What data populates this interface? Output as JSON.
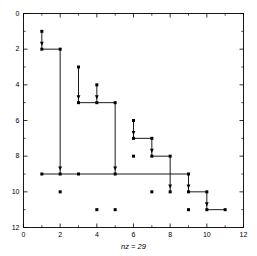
{
  "chart_data": {
    "type": "scatter",
    "title": "",
    "subtitle": "",
    "xlabel": "nz = 29",
    "ylabel": "",
    "xlim": [
      0,
      12
    ],
    "ylim": [
      12,
      0
    ],
    "y_axis_inverted": true,
    "grid": false,
    "legend": "none",
    "marker": "filled-square",
    "marker_color": "#000000",
    "marker_size_px": 3,
    "line_color": "#000000",
    "background_color": "#ffffff",
    "axis_color": "#000000",
    "nz": 29,
    "xticks": [
      0,
      2,
      4,
      6,
      8,
      10,
      12
    ],
    "yticks": [
      0,
      2,
      4,
      6,
      8,
      10,
      12
    ],
    "xtick_labels": [
      "0",
      "2",
      "4",
      "6",
      "8",
      "10",
      "12"
    ],
    "ytick_labels": [
      "0",
      "2",
      "4",
      "6",
      "8",
      "10",
      "12"
    ],
    "minor_xticks": [
      1,
      3,
      5,
      7,
      9,
      11
    ],
    "minor_yticks": [
      1,
      3,
      5,
      7,
      9,
      11
    ],
    "points": [
      {
        "x": 1,
        "y": 1
      },
      {
        "x": 1,
        "y": 2
      },
      {
        "x": 2,
        "y": 2
      },
      {
        "x": 3,
        "y": 3
      },
      {
        "x": 4,
        "y": 4
      },
      {
        "x": 3,
        "y": 5
      },
      {
        "x": 4,
        "y": 5
      },
      {
        "x": 5,
        "y": 5
      },
      {
        "x": 6,
        "y": 6
      },
      {
        "x": 6,
        "y": 7
      },
      {
        "x": 7,
        "y": 7
      },
      {
        "x": 6,
        "y": 8
      },
      {
        "x": 7,
        "y": 8
      },
      {
        "x": 8,
        "y": 8
      },
      {
        "x": 1,
        "y": 9
      },
      {
        "x": 2,
        "y": 9
      },
      {
        "x": 3,
        "y": 9
      },
      {
        "x": 5,
        "y": 9
      },
      {
        "x": 9,
        "y": 9
      },
      {
        "x": 2,
        "y": 10
      },
      {
        "x": 7,
        "y": 10
      },
      {
        "x": 8,
        "y": 10
      },
      {
        "x": 9,
        "y": 10
      },
      {
        "x": 10,
        "y": 10
      },
      {
        "x": 4,
        "y": 11
      },
      {
        "x": 5,
        "y": 11
      },
      {
        "x": 9,
        "y": 11
      },
      {
        "x": 10,
        "y": 11
      },
      {
        "x": 11,
        "y": 11
      }
    ],
    "edges": [
      {
        "x1": 1,
        "y1": 1,
        "x2": 1,
        "y2": 2,
        "arrow": true
      },
      {
        "x1": 1,
        "y1": 2,
        "x2": 2,
        "y2": 2,
        "arrow": false
      },
      {
        "x1": 2,
        "y1": 2,
        "x2": 2,
        "y2": 9,
        "arrow": true
      },
      {
        "x1": 3,
        "y1": 3,
        "x2": 3,
        "y2": 5,
        "arrow": true
      },
      {
        "x1": 4,
        "y1": 4,
        "x2": 4,
        "y2": 5,
        "arrow": true
      },
      {
        "x1": 3,
        "y1": 5,
        "x2": 5,
        "y2": 5,
        "arrow": false
      },
      {
        "x1": 5,
        "y1": 5,
        "x2": 5,
        "y2": 9,
        "arrow": true
      },
      {
        "x1": 6,
        "y1": 6,
        "x2": 6,
        "y2": 7,
        "arrow": true
      },
      {
        "x1": 6,
        "y1": 7,
        "x2": 7,
        "y2": 7,
        "arrow": false
      },
      {
        "x1": 7,
        "y1": 7,
        "x2": 7,
        "y2": 8,
        "arrow": true
      },
      {
        "x1": 7,
        "y1": 8,
        "x2": 8,
        "y2": 8,
        "arrow": false
      },
      {
        "x1": 8,
        "y1": 8,
        "x2": 8,
        "y2": 10,
        "arrow": true
      },
      {
        "x1": 1,
        "y1": 9,
        "x2": 9,
        "y2": 9,
        "arrow": false
      },
      {
        "x1": 9,
        "y1": 9,
        "x2": 9,
        "y2": 10,
        "arrow": true
      },
      {
        "x1": 9,
        "y1": 10,
        "x2": 10,
        "y2": 10,
        "arrow": false
      },
      {
        "x1": 10,
        "y1": 10,
        "x2": 10,
        "y2": 11,
        "arrow": true
      },
      {
        "x1": 10,
        "y1": 11,
        "x2": 11,
        "y2": 11,
        "arrow": false
      }
    ]
  }
}
